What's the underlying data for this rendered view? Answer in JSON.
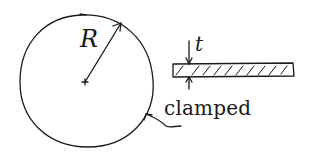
{
  "diagram": {
    "labels": {
      "radius": "R",
      "thickness": "t",
      "boundary": "clamped"
    },
    "elements": {
      "plate_top_view": {
        "shape": "circle",
        "label": "R"
      },
      "plate_cross_section": {
        "shape": "hatched-rectangle",
        "label": "t"
      },
      "boundary_leader": {
        "shape": "arrow",
        "label": "clamped"
      }
    },
    "colors": {
      "ink": "#1a1a1a",
      "background": "#ffffff"
    }
  }
}
